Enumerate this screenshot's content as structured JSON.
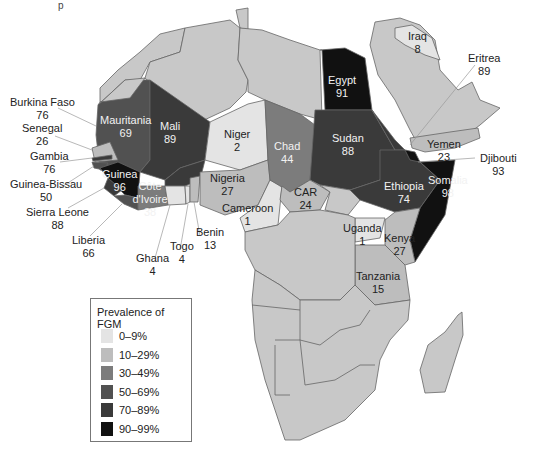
{
  "title_fragment": "p",
  "legend": {
    "title": "Prevalence of FGM",
    "items": [
      {
        "label": "0–9%",
        "color": "#e4e4e4"
      },
      {
        "label": "10–29%",
        "color": "#bdbdbd"
      },
      {
        "label": "30–49%",
        "color": "#7c7c7c"
      },
      {
        "label": "50–69%",
        "color": "#515151"
      },
      {
        "label": "70–89%",
        "color": "#3a3a3a"
      },
      {
        "label": "90–99%",
        "color": "#111111"
      }
    ]
  },
  "countries": [
    {
      "name": "Burkina Faso",
      "value": "76"
    },
    {
      "name": "Senegal",
      "value": "26"
    },
    {
      "name": "Gambia",
      "value": "76"
    },
    {
      "name": "Guinea-Bissau",
      "value": "50"
    },
    {
      "name": "Sierra Leone",
      "value": "88"
    },
    {
      "name": "Liberia",
      "value": "66"
    },
    {
      "name": "Ghana",
      "value": "4"
    },
    {
      "name": "Togo",
      "value": "4"
    },
    {
      "name": "Benin",
      "value": "13"
    },
    {
      "name": "Mauritania",
      "value": "69"
    },
    {
      "name": "Mali",
      "value": "89"
    },
    {
      "name": "Niger",
      "value": "2"
    },
    {
      "name": "Guinea",
      "value": "96"
    },
    {
      "name": "Côte d'Ivoire",
      "value": "38"
    },
    {
      "name": "Nigeria",
      "value": "27"
    },
    {
      "name": "Cameroon",
      "value": "1"
    },
    {
      "name": "Chad",
      "value": "44"
    },
    {
      "name": "CAR",
      "value": "24"
    },
    {
      "name": "Egypt",
      "value": "91"
    },
    {
      "name": "Sudan",
      "value": "88"
    },
    {
      "name": "Ethiopia",
      "value": "74"
    },
    {
      "name": "Somalia",
      "value": "98"
    },
    {
      "name": "Uganda",
      "value": "1"
    },
    {
      "name": "Kenya",
      "value": "27"
    },
    {
      "name": "Tanzania",
      "value": "15"
    },
    {
      "name": "Iraq",
      "value": "8"
    },
    {
      "name": "Eritrea",
      "value": "89"
    },
    {
      "name": "Yemen",
      "value": "23"
    },
    {
      "name": "Djibouti",
      "value": "93"
    }
  ],
  "colors": {
    "no_data": "#c8c8c8",
    "border": "#666666",
    "leader": "#999999"
  }
}
